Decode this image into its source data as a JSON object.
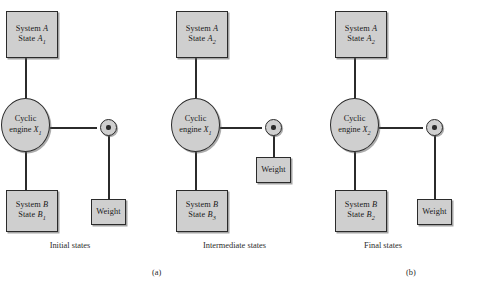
{
  "figure": {
    "background": "#ffffff",
    "shape_fill": "#cfcfcf",
    "stroke": "#2b2b2b"
  },
  "panels": [
    {
      "id": "initial",
      "caption": "Initial states",
      "sublabel": "(a)",
      "system_a": {
        "line1": "System",
        "symbol": "A",
        "line2": "State",
        "state_symbol": "A",
        "state_sub": "1"
      },
      "engine": {
        "line1": "Cyclic",
        "line2": "engine",
        "symbol": "X",
        "sub": "1"
      },
      "system_b": {
        "line1": "System",
        "symbol": "B",
        "line2": "State",
        "state_symbol": "B",
        "state_sub": "1"
      },
      "weight": {
        "label": "Weight"
      }
    },
    {
      "id": "intermediate",
      "caption": "Intermediate states",
      "sublabel": "",
      "system_a": {
        "line1": "System",
        "symbol": "A",
        "line2": "State",
        "state_symbol": "A",
        "state_sub": "2"
      },
      "engine": {
        "line1": "Cyclic",
        "line2": "engine",
        "symbol": "X",
        "sub": "1"
      },
      "system_b": {
        "line1": "System",
        "symbol": "B",
        "line2": "State",
        "state_symbol": "B",
        "state_sub": "3"
      },
      "weight": {
        "label": "Weight"
      }
    },
    {
      "id": "final",
      "caption": "Final states",
      "sublabel": "(b)",
      "system_a": {
        "line1": "System",
        "symbol": "A",
        "line2": "State",
        "state_symbol": "A",
        "state_sub": "2"
      },
      "engine": {
        "line1": "Cyclic",
        "line2": "engine",
        "symbol": "X",
        "sub": "2"
      },
      "system_b": {
        "line1": "System",
        "symbol": "B",
        "line2": "State",
        "state_symbol": "B",
        "state_sub": "2"
      },
      "weight": {
        "label": "Weight"
      }
    }
  ]
}
